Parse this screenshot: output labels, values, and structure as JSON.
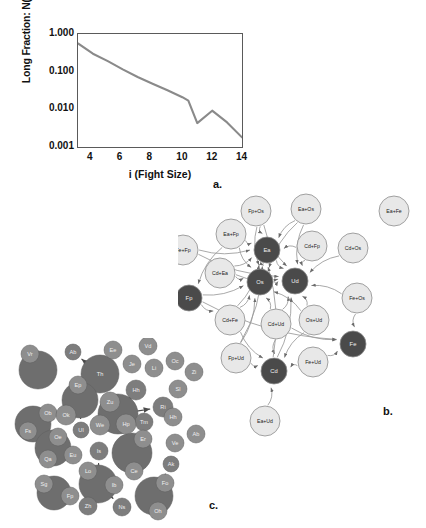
{
  "figure": {
    "panel_letters": {
      "a": "a.",
      "b": "b.",
      "c": "c."
    }
  },
  "chart_data": {
    "type": "line",
    "title": "",
    "xlabel": "i (Fight Size)",
    "ylabel": "Long Fraction: N(i)/N(>2)",
    "yscale": "log",
    "ylim": [
      0.001,
      1.0
    ],
    "xlim": [
      3,
      14
    ],
    "grid": false,
    "legend": "none",
    "yticklabels": [
      "1.000",
      "0.100",
      "0.010",
      "0.001"
    ],
    "ytickvalues": [
      1.0,
      0.1,
      0.01,
      0.001
    ],
    "xticklabels": [
      "4",
      "6",
      "8",
      "10",
      "12",
      "14"
    ],
    "xtickvalues": [
      4,
      6,
      8,
      10,
      12,
      14
    ],
    "x": [
      3,
      4,
      5,
      6,
      7,
      8,
      9,
      10,
      10.4,
      11,
      12,
      13,
      14
    ],
    "values": [
      0.56,
      0.3,
      0.19,
      0.115,
      0.072,
      0.048,
      0.032,
      0.021,
      0.017,
      0.0043,
      0.0092,
      0.0045,
      0.0018
    ],
    "series": [
      {
        "name": "Long fraction",
        "color": "#8a8a8a",
        "values": [
          0.56,
          0.3,
          0.19,
          0.115,
          0.072,
          0.048,
          0.032,
          0.021,
          0.017,
          0.0043,
          0.0092,
          0.0045,
          0.0018
        ]
      }
    ]
  },
  "network_b": {
    "caption": "b.",
    "colors": {
      "light_node": "#e8e8e8",
      "dark_node": "#4a4a4a",
      "edge": "#9a9a9a",
      "stroke": "#8c8c8c"
    },
    "nodes": [
      {
        "id": "n01",
        "label": "Fp+Os",
        "type": "light",
        "x": 78,
        "y": 18,
        "r": 15
      },
      {
        "id": "n02",
        "label": "Ea+Os",
        "type": "light",
        "x": 128,
        "y": 16,
        "r": 15
      },
      {
        "id": "n03",
        "label": "Ea+Fe",
        "type": "light",
        "x": 216,
        "y": 18,
        "r": 15
      },
      {
        "id": "n04",
        "label": "Ea+Fp",
        "type": "light",
        "x": 53,
        "y": 41,
        "r": 15
      },
      {
        "id": "n05",
        "label": "Fe+Fp",
        "type": "light",
        "x": 5,
        "y": 57,
        "r": 15
      },
      {
        "id": "n06",
        "label": "Ea",
        "type": "dark",
        "x": 89,
        "y": 57,
        "r": 13
      },
      {
        "id": "n07",
        "label": "Cd+Fp",
        "type": "light",
        "x": 134,
        "y": 53,
        "r": 15
      },
      {
        "id": "n08",
        "label": "Cd+Os",
        "type": "light",
        "x": 175,
        "y": 55,
        "r": 15
      },
      {
        "id": "n09",
        "label": "Cd+Ea",
        "type": "light",
        "x": 42,
        "y": 80,
        "r": 15
      },
      {
        "id": "n10",
        "label": "Os",
        "type": "dark",
        "x": 82,
        "y": 89,
        "r": 13
      },
      {
        "id": "n11",
        "label": "Ud",
        "type": "dark",
        "x": 117,
        "y": 88,
        "r": 13
      },
      {
        "id": "n12",
        "label": "Fp",
        "type": "dark",
        "x": 11,
        "y": 105,
        "r": 13
      },
      {
        "id": "n13",
        "label": "Fe+Os",
        "type": "light",
        "x": 179,
        "y": 105,
        "r": 15
      },
      {
        "id": "n14",
        "label": "Cd+Fe",
        "type": "light",
        "x": 52,
        "y": 127,
        "r": 15
      },
      {
        "id": "n15",
        "label": "Cd+Ud",
        "type": "light",
        "x": 98,
        "y": 131,
        "r": 15
      },
      {
        "id": "n16",
        "label": "Os+Ud",
        "type": "light",
        "x": 136,
        "y": 127,
        "r": 15
      },
      {
        "id": "n17",
        "label": "Fe",
        "type": "dark",
        "x": 175,
        "y": 151,
        "r": 13
      },
      {
        "id": "n18",
        "label": "Fp+Ud",
        "type": "light",
        "x": 58,
        "y": 165,
        "r": 15
      },
      {
        "id": "n19",
        "label": "Fe+Ud",
        "type": "light",
        "x": 135,
        "y": 169,
        "r": 15
      },
      {
        "id": "n20",
        "label": "Cd",
        "type": "dark",
        "x": 96,
        "y": 178,
        "r": 13
      },
      {
        "id": "n21",
        "label": "Ea+Ud",
        "type": "light",
        "x": 87,
        "y": 228,
        "r": 15
      }
    ],
    "edges": [
      [
        "n01",
        "n06"
      ],
      [
        "n01",
        "n10"
      ],
      [
        "n01",
        "n11"
      ],
      [
        "n02",
        "n06"
      ],
      [
        "n02",
        "n11"
      ],
      [
        "n02",
        "n10"
      ],
      [
        "n04",
        "n06"
      ],
      [
        "n04",
        "n10"
      ],
      [
        "n04",
        "n12"
      ],
      [
        "n05",
        "n06"
      ],
      [
        "n05",
        "n11"
      ],
      [
        "n07",
        "n06"
      ],
      [
        "n07",
        "n11"
      ],
      [
        "n08",
        "n11"
      ],
      [
        "n09",
        "n10"
      ],
      [
        "n09",
        "n06"
      ],
      [
        "n09",
        "n11"
      ],
      [
        "n12",
        "n10"
      ],
      [
        "n12",
        "n14"
      ],
      [
        "n13",
        "n11"
      ],
      [
        "n13",
        "n17"
      ],
      [
        "n14",
        "n10"
      ],
      [
        "n14",
        "n06"
      ],
      [
        "n14",
        "n20"
      ],
      [
        "n15",
        "n11"
      ],
      [
        "n15",
        "n10"
      ],
      [
        "n15",
        "n20"
      ],
      [
        "n15",
        "n17"
      ],
      [
        "n16",
        "n11"
      ],
      [
        "n16",
        "n20"
      ],
      [
        "n16",
        "n10"
      ],
      [
        "n18",
        "n20"
      ],
      [
        "n18",
        "n10"
      ],
      [
        "n18",
        "n06"
      ],
      [
        "n19",
        "n20"
      ],
      [
        "n19",
        "n17"
      ],
      [
        "n20",
        "n11"
      ],
      [
        "n20",
        "n06"
      ],
      [
        "n21",
        "n20"
      ],
      [
        "n06",
        "n10"
      ],
      [
        "n06",
        "n11"
      ],
      [
        "n10",
        "n11"
      ],
      [
        "n12",
        "n17"
      ]
    ]
  },
  "cluster_c": {
    "caption": "c.",
    "colors": {
      "big_blob": "#6e6e6e",
      "small_node": "#7d7d7d",
      "label_node": "#8e8e8e",
      "arrow": "#4a4a4a"
    },
    "nodes": [
      {
        "label": "Vr",
        "x": 22,
        "y": 16,
        "r": 9,
        "kind": "tag"
      },
      {
        "label": "",
        "x": 30,
        "y": 32,
        "r": 19,
        "kind": "blob"
      },
      {
        "label": "Ab",
        "x": 65,
        "y": 14,
        "r": 8,
        "kind": "small"
      },
      {
        "label": "Ee",
        "x": 105,
        "y": 12,
        "r": 9,
        "kind": "tag"
      },
      {
        "label": "Th",
        "x": 92,
        "y": 36,
        "r": 19,
        "kind": "blob"
      },
      {
        "label": "Vd",
        "x": 140,
        "y": 8,
        "r": 9,
        "kind": "tag"
      },
      {
        "label": "Je",
        "x": 124,
        "y": 26,
        "r": 9,
        "kind": "tag"
      },
      {
        "label": "Li",
        "x": 146,
        "y": 30,
        "r": 9,
        "kind": "tag"
      },
      {
        "label": "Hh",
        "x": 128,
        "y": 52,
        "r": 10,
        "kind": "small"
      },
      {
        "label": "Oc",
        "x": 167,
        "y": 23,
        "r": 9,
        "kind": "tag"
      },
      {
        "label": "Zi",
        "x": 186,
        "y": 34,
        "r": 9,
        "kind": "tag"
      },
      {
        "label": "Sl",
        "x": 170,
        "y": 51,
        "r": 9,
        "kind": "tag"
      },
      {
        "label": "Ep",
        "x": 70,
        "y": 47,
        "r": 9,
        "kind": "tag"
      },
      {
        "label": "",
        "x": 72,
        "y": 62,
        "r": 18,
        "kind": "blob"
      },
      {
        "label": "Zu",
        "x": 102,
        "y": 64,
        "r": 10,
        "kind": "tag"
      },
      {
        "label": "Ri",
        "x": 155,
        "y": 69,
        "r": 10,
        "kind": "small"
      },
      {
        "label": "Ob",
        "x": 40,
        "y": 75,
        "r": 9,
        "kind": "tag"
      },
      {
        "label": "Ok",
        "x": 58,
        "y": 77,
        "r": 10,
        "kind": "tag"
      },
      {
        "label": "",
        "x": 25,
        "y": 86,
        "r": 18,
        "kind": "blob"
      },
      {
        "label": "Fs",
        "x": 20,
        "y": 93,
        "r": 9,
        "kind": "tag"
      },
      {
        "label": "Hh",
        "x": 165,
        "y": 79,
        "r": 9,
        "kind": "tag"
      },
      {
        "label": "Tm",
        "x": 136,
        "y": 84,
        "r": 9,
        "kind": "small"
      },
      {
        "label": "We",
        "x": 92,
        "y": 87,
        "r": 10,
        "kind": "tag"
      },
      {
        "label": "Hp",
        "x": 118,
        "y": 86,
        "r": 10,
        "kind": "tag"
      },
      {
        "label": "",
        "x": 110,
        "y": 76,
        "r": 20,
        "kind": "blob"
      },
      {
        "label": "Ab",
        "x": 188,
        "y": 96,
        "r": 9,
        "kind": "tag"
      },
      {
        "label": "Ve",
        "x": 167,
        "y": 105,
        "r": 9,
        "kind": "tag"
      },
      {
        "label": "Ul",
        "x": 73,
        "y": 92,
        "r": 8,
        "kind": "small"
      },
      {
        "label": "Oe",
        "x": 50,
        "y": 99,
        "r": 9,
        "kind": "tag"
      },
      {
        "label": "",
        "x": 45,
        "y": 110,
        "r": 18,
        "kind": "blob"
      },
      {
        "label": "Qa",
        "x": 40,
        "y": 121,
        "r": 9,
        "kind": "tag"
      },
      {
        "label": "Eu",
        "x": 65,
        "y": 117,
        "r": 9,
        "kind": "tag"
      },
      {
        "label": "Er",
        "x": 135,
        "y": 101,
        "r": 9,
        "kind": "tag"
      },
      {
        "label": "",
        "x": 124,
        "y": 115,
        "r": 20,
        "kind": "blob"
      },
      {
        "label": "Ce",
        "x": 126,
        "y": 133,
        "r": 9,
        "kind": "tag"
      },
      {
        "label": "Is",
        "x": 91,
        "y": 113,
        "r": 9,
        "kind": "small"
      },
      {
        "label": "Ak",
        "x": 163,
        "y": 126,
        "r": 8,
        "kind": "small"
      },
      {
        "label": "Sg",
        "x": 36,
        "y": 146,
        "r": 9,
        "kind": "tag"
      },
      {
        "label": "",
        "x": 46,
        "y": 155,
        "r": 17,
        "kind": "blob"
      },
      {
        "label": "Fp",
        "x": 62,
        "y": 158,
        "r": 9,
        "kind": "tag"
      },
      {
        "label": "Lo",
        "x": 80,
        "y": 133,
        "r": 9,
        "kind": "tag"
      },
      {
        "label": "",
        "x": 90,
        "y": 146,
        "r": 19,
        "kind": "blob"
      },
      {
        "label": "Ib",
        "x": 106,
        "y": 147,
        "r": 9,
        "kind": "tag"
      },
      {
        "label": "Zh",
        "x": 80,
        "y": 168,
        "r": 9,
        "kind": "small"
      },
      {
        "label": "Fo",
        "x": 157,
        "y": 145,
        "r": 9,
        "kind": "tag"
      },
      {
        "label": "",
        "x": 146,
        "y": 158,
        "r": 19,
        "kind": "blob"
      },
      {
        "label": "Oh",
        "x": 150,
        "y": 173,
        "r": 9,
        "kind": "tag"
      },
      {
        "label": "Ns",
        "x": 114,
        "y": 169,
        "r": 9,
        "kind": "small"
      }
    ]
  }
}
